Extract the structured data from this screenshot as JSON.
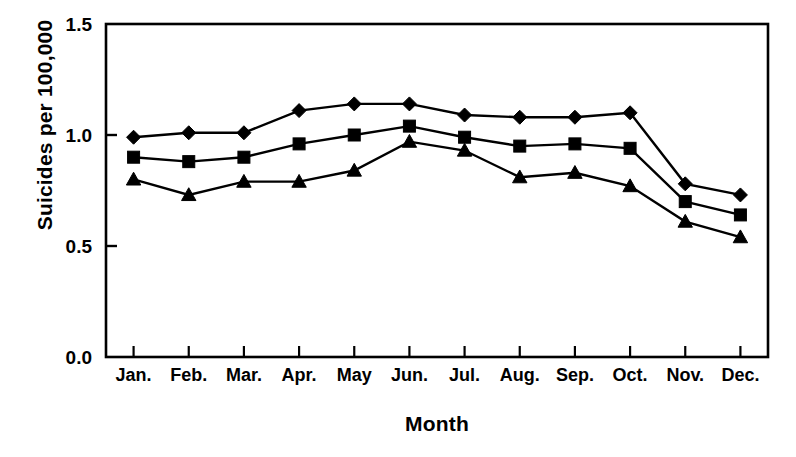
{
  "chart_data": {
    "type": "line",
    "title": "",
    "xlabel": "Month",
    "ylabel": "Suicides per 100,000",
    "categories": [
      "Jan.",
      "Feb.",
      "Mar.",
      "Apr.",
      "May",
      "Jun.",
      "Jul.",
      "Aug.",
      "Sep.",
      "Oct.",
      "Nov.",
      "Dec."
    ],
    "ylim": [
      0.0,
      1.5
    ],
    "yticks": [
      "0.0",
      "0.5",
      "1.0",
      "1.5"
    ],
    "ytick_values": [
      0.0,
      0.5,
      1.0,
      1.5
    ],
    "grid": false,
    "legend": "none",
    "series": [
      {
        "name": "diamond-series",
        "marker": "diamond",
        "color": "#000000",
        "values": [
          0.99,
          1.01,
          1.01,
          1.11,
          1.14,
          1.14,
          1.09,
          1.08,
          1.08,
          1.1,
          0.78,
          0.73
        ]
      },
      {
        "name": "square-series",
        "marker": "square",
        "color": "#000000",
        "values": [
          0.9,
          0.88,
          0.9,
          0.96,
          1.0,
          1.04,
          0.99,
          0.95,
          0.96,
          0.94,
          0.7,
          0.64
        ]
      },
      {
        "name": "triangle-series",
        "marker": "triangle",
        "color": "#000000",
        "values": [
          0.8,
          0.73,
          0.79,
          0.79,
          0.84,
          0.97,
          0.93,
          0.81,
          0.83,
          0.77,
          0.61,
          0.54
        ]
      }
    ]
  }
}
